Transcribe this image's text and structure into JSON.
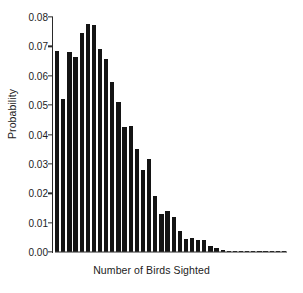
{
  "chart_data": {
    "type": "bar",
    "title": "",
    "xlabel": "Number of Birds Sighted",
    "ylabel": "Probability",
    "ylim": [
      0.0,
      0.08
    ],
    "ytick_labels": [
      "0.00",
      "0.01",
      "0.02",
      "0.03",
      "0.04",
      "0.05",
      "0.06",
      "0.07",
      "0.08"
    ],
    "ytick_values": [
      0.0,
      0.01,
      0.02,
      0.03,
      0.04,
      0.05,
      0.06,
      0.07,
      0.08
    ],
    "xtick_labels": [],
    "grid": false,
    "legend": null,
    "bar_color": "#141414",
    "axis_color": "#2a2a2a",
    "categories": [
      "1",
      "2",
      "3",
      "4",
      "5",
      "6",
      "7",
      "8",
      "9",
      "10",
      "11",
      "12",
      "13",
      "14",
      "15",
      "16",
      "17",
      "18",
      "19",
      "20",
      "21",
      "22",
      "23",
      "24",
      "25",
      "26",
      "27",
      "28",
      "29",
      "30",
      "31",
      "32",
      "33",
      "34",
      "35",
      "36",
      "37",
      "38"
    ],
    "values": [
      0.0685,
      0.0522,
      0.0682,
      0.0665,
      0.0745,
      0.0775,
      0.0772,
      0.0692,
      0.0658,
      0.0578,
      0.051,
      0.0425,
      0.043,
      0.035,
      0.028,
      0.0318,
      0.0192,
      0.013,
      0.014,
      0.012,
      0.007,
      0.0045,
      0.0048,
      0.0042,
      0.004,
      0.0022,
      0.0015,
      0.0008,
      0.0005,
      0.0005,
      0.0004,
      0.0003,
      0.0003,
      0.0002,
      0.0002,
      0.0002,
      0.0001,
      0.0001
    ]
  }
}
